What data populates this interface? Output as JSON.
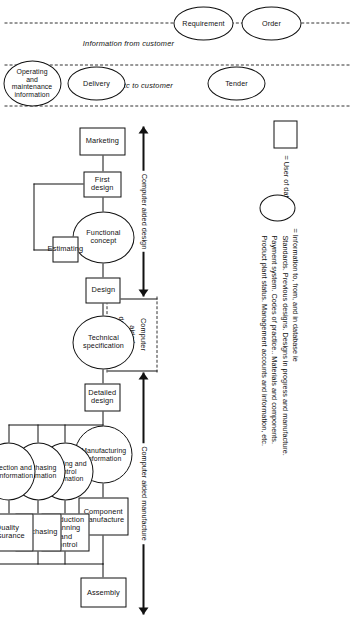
{
  "figure": {
    "orientation": "rotated-90-clockwise"
  },
  "swimlanes": [
    {
      "id": "info-from-customer",
      "label": "Information from customer"
    },
    {
      "id": "info-etc-to-customer",
      "label": "Information etc to customer"
    }
  ],
  "spans": [
    {
      "id": "cad",
      "label": "Computer aided design"
    },
    {
      "id": "cadr",
      "label_line1": "Computer",
      "label_line2": "aided",
      "label_line3": "draughting"
    },
    {
      "id": "cam",
      "label": "Computer aided manufacture"
    }
  ],
  "customer_nodes": [
    {
      "id": "requirement",
      "label": "Requirement",
      "shape": "ellipse"
    },
    {
      "id": "order",
      "label": "Order",
      "shape": "ellipse"
    },
    {
      "id": "tender",
      "label": "Tender",
      "shape": "ellipse"
    },
    {
      "id": "delivery",
      "label": "Delivery",
      "shape": "ellipse"
    },
    {
      "id": "operating-maintenance",
      "label": "Operating and maintenance information",
      "shape": "ellipse"
    }
  ],
  "process_nodes": [
    {
      "id": "marketing",
      "label": "Marketing",
      "shape": "box"
    },
    {
      "id": "first-design",
      "label": "First design",
      "shape": "box"
    },
    {
      "id": "functional-concept",
      "label": "Functional concept",
      "shape": "ellipse"
    },
    {
      "id": "design",
      "label": "Design",
      "shape": "box"
    },
    {
      "id": "technical-specification",
      "label": "Technical specification",
      "shape": "ellipse"
    },
    {
      "id": "detailed-design",
      "label": "Detailed design",
      "shape": "box"
    },
    {
      "id": "estimating",
      "label": "Estimating",
      "shape": "box"
    },
    {
      "id": "manufacturing-information",
      "label": "Manufacturing information",
      "shape": "ellipse"
    },
    {
      "id": "planning-and-control-information",
      "label": "Planning and control information",
      "shape": "ellipse"
    },
    {
      "id": "purchasing-information",
      "label": "Purchasing information",
      "shape": "ellipse"
    },
    {
      "id": "inspection-and-test-information",
      "label": "Inspection and test information",
      "shape": "ellipse"
    },
    {
      "id": "component-manufacture",
      "label": "Component manufacture",
      "shape": "box"
    },
    {
      "id": "production-planning-and-control",
      "label": "Production planning and control",
      "shape": "box"
    },
    {
      "id": "purchasing",
      "label": "Purchasing",
      "shape": "box"
    },
    {
      "id": "quality-assurance",
      "label": "Quality assurance",
      "shape": "box"
    },
    {
      "id": "assembly",
      "label": "Assembly",
      "shape": "box"
    }
  ],
  "legend": {
    "box_entry": "= User of database",
    "ellipse_entry_lines": [
      "= Information to, from, and in database ie",
      "Standards. Previous designs. Designs in progress and manufacture.",
      "Payment system. Codes of practice.. Materials and components.",
      "Product plant status. Management accounts and information, etc."
    ]
  },
  "colors": {
    "stroke": "#111111",
    "background": "#ffffff",
    "dashed": "#333333"
  }
}
